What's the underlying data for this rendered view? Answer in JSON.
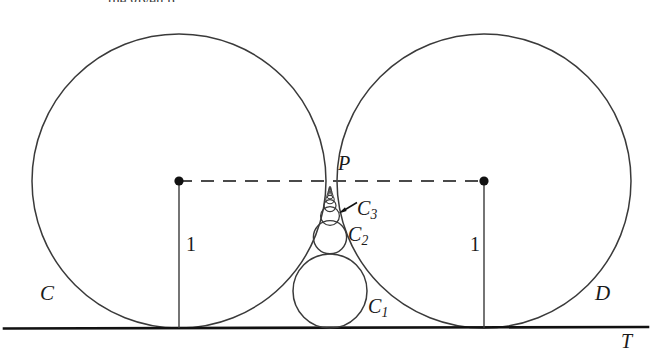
{
  "figure": {
    "canvas": {
      "width": 652,
      "height": 355
    },
    "background_color": "#ffffff",
    "stroke_color": "#3a3a3a",
    "baseline_color": "#111111",
    "dash_color": "#4a4a4a"
  },
  "labels": {
    "circle_c": "C",
    "circle_d": "D",
    "tangent_line": "T",
    "tangent_point": "P",
    "radius_left": "1",
    "radius_right": "1",
    "chain_1": {
      "base": "C",
      "sub": "1"
    },
    "chain_2": {
      "base": "C",
      "sub": "2"
    },
    "chain_3": {
      "base": "C",
      "sub": "3"
    }
  },
  "geometry": {
    "tangent_line_y": 328,
    "big_circles": [
      {
        "name": "C",
        "cx": 179,
        "cy": 181,
        "r": 147
      },
      {
        "name": "D",
        "cx": 484,
        "cy": 181,
        "r": 147
      }
    ],
    "tangent_point": {
      "x": 331.5,
      "y": 181
    },
    "center_dots": [
      {
        "x": 179,
        "y": 181,
        "r": 4.6
      },
      {
        "x": 484,
        "y": 181,
        "r": 4.6
      }
    ],
    "dashed_segment": {
      "x1": 179,
      "y1": 181,
      "x2": 484,
      "y2": 181
    },
    "vertical_segments": [
      {
        "x": 179,
        "y1": 181,
        "y2": 328
      },
      {
        "x": 484,
        "y1": 181,
        "y2": 328
      }
    ],
    "chain_circles": [
      {
        "name": "C1",
        "cx": 330,
        "cy": 291.0,
        "r": 37.0
      },
      {
        "name": "C2",
        "cx": 330,
        "cy": 237.2,
        "r": 16.6
      },
      {
        "name": "C3",
        "cx": 330,
        "cy": 216.0,
        "r": 9.4
      },
      {
        "name": "C4",
        "cx": 330,
        "cy": 205.6,
        "r": 6.0
      },
      {
        "name": "C5",
        "cx": 330,
        "cy": 199.6,
        "r": 4.2
      },
      {
        "name": "C6",
        "cx": 330,
        "cy": 195.8,
        "r": 3.1
      },
      {
        "name": "C7",
        "cx": 330,
        "cy": 193.2,
        "r": 2.3
      },
      {
        "name": "C8",
        "cx": 330,
        "cy": 191.4,
        "r": 1.8
      },
      {
        "name": "C9",
        "cx": 330,
        "cy": 190.0,
        "r": 1.5
      },
      {
        "name": "C10",
        "cx": 330,
        "cy": 188.9,
        "r": 1.2
      },
      {
        "name": "C11",
        "cx": 330,
        "cy": 188.0,
        "r": 1.0
      },
      {
        "name": "C12",
        "cx": 330,
        "cy": 187.2,
        "r": 0.8
      }
    ],
    "arrow": {
      "x1": 356,
      "y1": 203,
      "x2": 340,
      "y2": 212
    }
  },
  "header_remnant": "the given p"
}
